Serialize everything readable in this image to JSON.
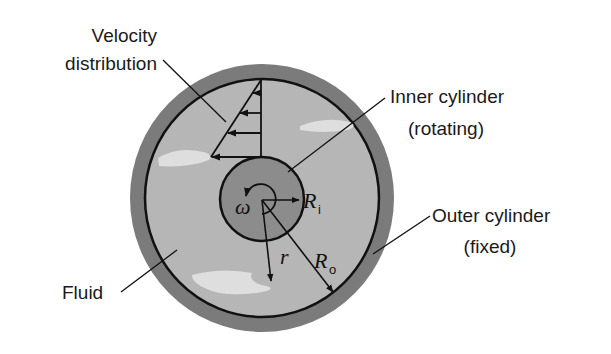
{
  "diagram": {
    "colors": {
      "outer_cylinder": "#7b7b7b",
      "fluid": "#b6b6b6",
      "fluid_highlight": "#e2e2e2",
      "inner_cylinder": "#8c8c8c",
      "stroke": "#111111"
    },
    "labels": {
      "velocity_line1": "Velocity",
      "velocity_line2": "distribution",
      "inner_line1": "Inner cylinder",
      "inner_line2": "(rotating)",
      "outer_line1": "Outer cylinder",
      "outer_line2": "(fixed)",
      "fluid": "Fluid"
    },
    "symbols": {
      "omega": "ω",
      "Ri_main": "R",
      "Ri_sub": "i",
      "Ro_main": "R",
      "Ro_sub": "o",
      "r": "r"
    }
  }
}
